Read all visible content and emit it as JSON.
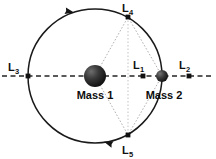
{
  "diagram": {
    "background_color": "#ffffff",
    "stroke_color": "#1a1a1a",
    "dash_color": "#2b2b2b",
    "dotted_color": "#9a9a9a",
    "mass1_color": "#2a2a2a",
    "mass2_color": "#3a3a3a",
    "point_color": "#111111"
  },
  "bodies": [
    {
      "id": "mass1",
      "label": "Mass 1",
      "cx": 95,
      "cy": 76,
      "r": 11,
      "label_x": 95,
      "label_y": 98
    },
    {
      "id": "mass2",
      "label": "Mass 2",
      "cx": 162,
      "cy": 76,
      "r": 6,
      "label_x": 163,
      "label_y": 98
    }
  ],
  "orbit": {
    "cx": 95,
    "cy": 76,
    "r": 67,
    "direction": "counterclockwise"
  },
  "axis": {
    "y": 76,
    "x_start": 0,
    "x_end": 216,
    "style": "dashed"
  },
  "lagrange_points": [
    {
      "id": "L1",
      "base": "L",
      "sub": "1",
      "x": 143,
      "y": 76,
      "label_x": 136,
      "label_y": 68
    },
    {
      "id": "L2",
      "base": "L",
      "sub": "2",
      "x": 189,
      "y": 76,
      "label_x": 182,
      "label_y": 68
    },
    {
      "id": "L3",
      "base": "L",
      "sub": "3",
      "x": 28,
      "y": 76,
      "label_x": 11,
      "label_y": 70
    },
    {
      "id": "L4",
      "base": "L",
      "sub": "4",
      "x": 128,
      "y": 17,
      "label_x": 124,
      "label_y": 12
    },
    {
      "id": "L5",
      "base": "L",
      "sub": "5",
      "x": 128,
      "y": 135,
      "label_x": 124,
      "label_y": 153
    }
  ],
  "triangle_edges": [
    {
      "from": "mass1",
      "to": "L4",
      "x1": 95,
      "y1": 76,
      "x2": 128,
      "y2": 17
    },
    {
      "from": "mass1",
      "to": "L5",
      "x1": 95,
      "y1": 76,
      "x2": 128,
      "y2": 135
    },
    {
      "from": "mass2",
      "to": "L4",
      "x1": 162,
      "y1": 76,
      "x2": 128,
      "y2": 17
    },
    {
      "from": "mass2",
      "to": "L5",
      "x1": 162,
      "y1": 76,
      "x2": 128,
      "y2": 135
    },
    {
      "from": "L4",
      "to": "L5",
      "x1": 128,
      "y1": 17,
      "x2": 128,
      "y2": 135
    }
  ],
  "arrows": [
    {
      "id": "orbit-arrow-top",
      "x": 76,
      "y": 12.2,
      "rotation": 192,
      "direction": "left"
    },
    {
      "id": "orbit-arrow-bottom",
      "x": 110,
      "y": 141.5,
      "rotation": 20,
      "direction": "right"
    }
  ]
}
